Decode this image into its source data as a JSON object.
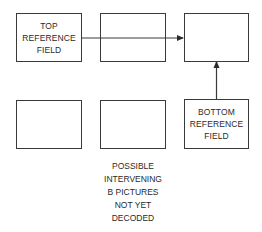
{
  "diagram": {
    "boxes": {
      "top_reference": {
        "lines": [
          "TOP",
          "REFERENCE",
          "FIELD"
        ]
      },
      "top_middle": {
        "lines": []
      },
      "top_right": {
        "lines": []
      },
      "bottom_left": {
        "lines": []
      },
      "bottom_middle": {
        "lines": []
      },
      "bottom_reference": {
        "lines": [
          "BOTTOM",
          "REFERENCE",
          "FIELD"
        ]
      }
    },
    "arrows": [
      {
        "from": "top_reference",
        "to": "top_right",
        "direction": "right"
      },
      {
        "from": "bottom_reference",
        "to": "top_right",
        "direction": "up"
      }
    ],
    "caption": [
      "POSSIBLE",
      "INTERVENING",
      "B PICTURES",
      "NOT YET",
      "DECODED"
    ],
    "colors": {
      "line": "#3a3a3a",
      "text": "#2a2a2a",
      "background": "#ffffff"
    }
  }
}
